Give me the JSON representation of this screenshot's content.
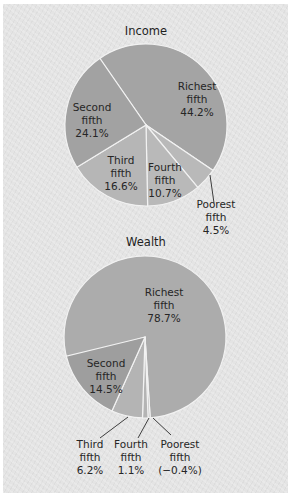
{
  "chart_data": [
    {
      "type": "pie",
      "title": "Income",
      "categories": [
        "Richest fifth",
        "Poorest fifth",
        "Fourth fifth",
        "Third fifth",
        "Second fifth"
      ],
      "values": [
        44.2,
        4.5,
        10.7,
        16.6,
        24.1
      ],
      "labels": [
        {
          "lines": [
            "Richest",
            "fifth",
            "44.2%"
          ]
        },
        {
          "lines": [
            "Poorest",
            "fifth",
            "4.5%"
          ]
        },
        {
          "lines": [
            "Fourth",
            "fifth",
            "10.7%"
          ]
        },
        {
          "lines": [
            "Third",
            "fifth",
            "16.6%"
          ]
        },
        {
          "lines": [
            "Second",
            "fifth",
            "24.1%"
          ]
        }
      ],
      "colors": [
        "#a4a4a4",
        "#b9b9b9",
        "#b9b9b9",
        "#b6b6b6",
        "#a2a2a2"
      ],
      "unit": "%"
    },
    {
      "type": "pie",
      "title": "Wealth",
      "categories": [
        "Richest fifth",
        "Poorest fifth",
        "Fourth fifth",
        "Third fifth",
        "Second fifth"
      ],
      "values": [
        78.7,
        -0.4,
        1.1,
        6.2,
        14.5
      ],
      "labels": [
        {
          "lines": [
            "Richest",
            "fifth",
            "78.7%"
          ]
        },
        {
          "lines": [
            "Poorest",
            "fifth",
            "(−0.4%)"
          ]
        },
        {
          "lines": [
            "Fourth",
            "fifth",
            "1.1%"
          ]
        },
        {
          "lines": [
            "Third",
            "fifth",
            "6.2%"
          ]
        },
        {
          "lines": [
            "Second",
            "fifth",
            "14.5%"
          ]
        }
      ],
      "colors": [
        "#acacac",
        "#b4b4b4",
        "#b4b4b4",
        "#b4b4b4",
        "#9e9e9e"
      ],
      "unit": "%"
    }
  ]
}
